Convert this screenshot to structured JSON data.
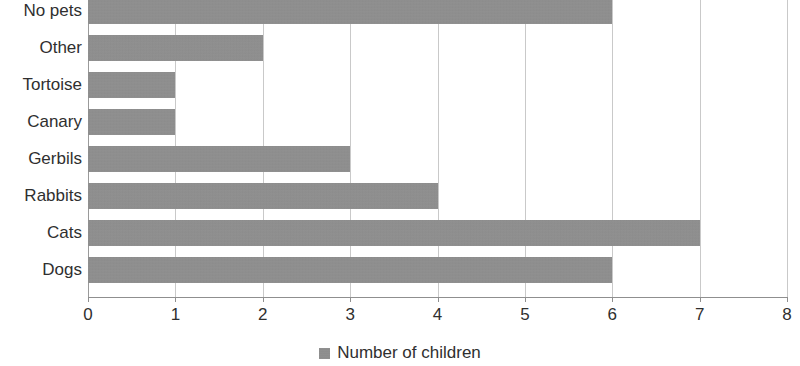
{
  "chart_data": {
    "type": "bar",
    "orientation": "horizontal",
    "title": "",
    "xlabel": "",
    "ylabel": "",
    "categories": [
      "No pets",
      "Other",
      "Tortoise",
      "Canary",
      "Gerbils",
      "Rabbits",
      "Cats",
      "Dogs"
    ],
    "values": [
      6,
      2,
      1,
      1,
      3,
      4,
      7,
      6
    ],
    "series": [
      {
        "name": "Number of children",
        "values": [
          6,
          2,
          1,
          1,
          3,
          4,
          7,
          6
        ]
      }
    ],
    "xlim": [
      0,
      8
    ],
    "xticks": [
      0,
      1,
      2,
      3,
      4,
      5,
      6,
      7,
      8
    ],
    "xtick_labels": [
      "0",
      "1",
      "2",
      "3",
      "4",
      "5",
      "6",
      "7",
      "8"
    ],
    "grid": true,
    "grid_axis": "x",
    "legend": {
      "position": "bottom",
      "entries": [
        {
          "label": "Number of children",
          "color": "#8d8d8d"
        }
      ]
    },
    "colors": {
      "bar": "#8d8d8d",
      "gridline": "#c9c9c9",
      "axis": "#8f8f8f",
      "text": "#2f2f2f",
      "background": "#ffffff"
    }
  }
}
